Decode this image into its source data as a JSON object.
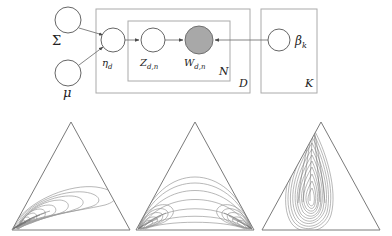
{
  "figure": {
    "name": "correlated-topic-model-figure",
    "width": 392,
    "height": 236,
    "background": "#ffffff"
  },
  "graphical_model": {
    "name": "plate-diagram",
    "node_stroke": "#555555",
    "plate_stroke": "#aaaaaa",
    "edge_color": "#777777",
    "observed_fill": "#a8a8a8",
    "latent_fill": "#ffffff",
    "nodes": [
      {
        "id": "sigma",
        "label": "Σ",
        "x": 68,
        "y": 20,
        "r": 13,
        "observed": false,
        "label_x": 52,
        "label_y": 45,
        "label_size": 13
      },
      {
        "id": "mu",
        "label": "μ",
        "x": 68,
        "y": 73,
        "r": 13,
        "observed": false,
        "label_x": 63,
        "label_y": 97,
        "label_size": 13
      },
      {
        "id": "eta_d",
        "label": "η",
        "sub": "d",
        "x": 113,
        "y": 40,
        "r": 12,
        "observed": false,
        "label_x": 102,
        "label_y": 66,
        "label_size": 10
      },
      {
        "id": "z_dn",
        "label": "Z",
        "sub": "d,n",
        "x": 153,
        "y": 40,
        "r": 12,
        "observed": false,
        "label_x": 140,
        "label_y": 66,
        "label_size": 10
      },
      {
        "id": "w_dn",
        "label": "W",
        "sub": "d,n",
        "x": 199,
        "y": 40,
        "r": 14,
        "observed": true,
        "label_x": 184,
        "label_y": 66,
        "label_size": 10
      },
      {
        "id": "beta_k",
        "label": "β",
        "sub": "k",
        "x": 279,
        "y": 40,
        "r": 11,
        "observed": false,
        "label_x": 295,
        "label_y": 45,
        "label_size": 11
      }
    ],
    "edges": [
      {
        "from": "sigma",
        "to": "eta_d",
        "arrow": true
      },
      {
        "from": "mu",
        "to": "eta_d",
        "arrow": true
      },
      {
        "from": "eta_d",
        "to": "z_dn",
        "arrow": true
      },
      {
        "from": "z_dn",
        "to": "w_dn",
        "arrow": true
      },
      {
        "from": "beta_k",
        "to": "w_dn",
        "arrow": true
      }
    ],
    "plates": [
      {
        "id": "plate_D",
        "label": "D",
        "x": 96,
        "y": 9,
        "w": 154,
        "h": 84,
        "label_x": 239,
        "label_y": 86
      },
      {
        "id": "plate_N",
        "label": "N",
        "x": 128,
        "y": 21,
        "w": 102,
        "h": 60,
        "label_x": 219,
        "label_y": 75
      },
      {
        "id": "plate_K",
        "label": "K",
        "x": 261,
        "y": 9,
        "w": 56,
        "h": 84,
        "label_x": 306,
        "label_y": 86
      }
    ]
  },
  "simplex_plots": {
    "name": "logistic-normal-contour-plots",
    "triangle_stroke": "#7a7a7a",
    "contour_stroke": "#9a9a9a",
    "plots": [
      {
        "id": "plot-left",
        "name": "simplex-plot-left",
        "description": "single mode near bottom-left vertex, elongated lobe toward center-right",
        "origin_x": 12,
        "origin_y": 122,
        "width": 118,
        "height": 108,
        "mode_type": "unimodal-corner",
        "contour_levels": 9
      },
      {
        "id": "plot-middle",
        "name": "simplex-plot-middle",
        "description": "bimodal, two modes at bottom-left and bottom-right vertices with broad arcs across base",
        "origin_x": 136,
        "origin_y": 122,
        "width": 118,
        "height": 108,
        "mode_type": "bimodal-corners",
        "contour_levels": 9
      },
      {
        "id": "plot-right",
        "name": "simplex-plot-right",
        "description": "narrow vertical teardrop mode along the left-center axis toward the top vertex",
        "origin_x": 262,
        "origin_y": 122,
        "width": 118,
        "height": 108,
        "mode_type": "unimodal-vertical",
        "contour_levels": 11
      }
    ]
  }
}
